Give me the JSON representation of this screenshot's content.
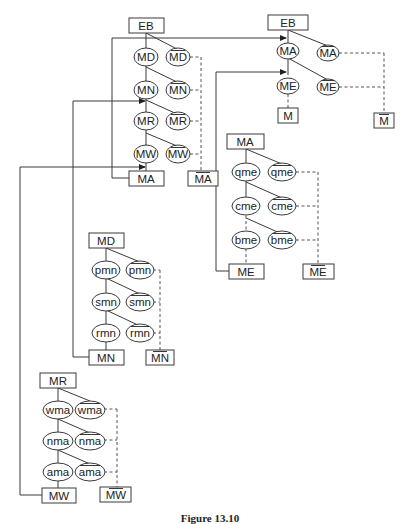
{
  "caption": "Figure 13.10",
  "trees": [
    {
      "id": "eb-top",
      "root": "EB",
      "chain": [
        {
          "left": "MA",
          "right": "MA",
          "right_overline": true
        },
        {
          "left": "ME",
          "right": "ME",
          "right_overline": true
        }
      ],
      "outputs": {
        "left": "M",
        "right": "M",
        "right_overline": true
      }
    },
    {
      "id": "eb-mid",
      "root": "EB",
      "chain": [
        {
          "left": "MD",
          "right": "MD",
          "right_overline": true
        },
        {
          "left": "MN",
          "right": "MN",
          "right_overline": true
        },
        {
          "left": "MR",
          "right": "MR",
          "right_overline": true
        },
        {
          "left": "MW",
          "right": "MW",
          "right_overline": true
        }
      ],
      "outputs": {
        "left": "MA",
        "right": "MA",
        "right_overline": true
      }
    },
    {
      "id": "ma",
      "root": "MA",
      "chain": [
        {
          "left": "qme",
          "right": "qme",
          "right_overline": true
        },
        {
          "left": "cme",
          "right": "cme",
          "right_overline": true
        },
        {
          "left": "bme",
          "right": "bme",
          "right_overline": true
        }
      ],
      "outputs": {
        "left": "ME",
        "right": "ME",
        "right_overline": true
      }
    },
    {
      "id": "md",
      "root": "MD",
      "chain": [
        {
          "left": "pmn",
          "right": "pmn",
          "right_overline": true
        },
        {
          "left": "smn",
          "right": "smn",
          "right_overline": true
        },
        {
          "left": "rmn",
          "right": "rmn",
          "right_overline": true
        }
      ],
      "outputs": {
        "left": "MN",
        "right": "MN",
        "right_overline": true
      }
    },
    {
      "id": "mr",
      "root": "MR",
      "chain": [
        {
          "left": "wma",
          "right": "wma",
          "right_overline": true
        },
        {
          "left": "nma",
          "right": "nma",
          "right_overline": true
        },
        {
          "left": "ama",
          "right": "ama",
          "right_overline": true
        }
      ],
      "outputs": {
        "left": "MW",
        "right": "MW",
        "right_overline": true
      }
    }
  ],
  "feedback_links": [
    {
      "from": "eb-mid.outputs.left (MA)",
      "to": "eb-top.chain.0 (MA)"
    },
    {
      "from": "ma.outputs.left (ME)",
      "to": "eb-top.chain.1 (ME)"
    },
    {
      "from": "md.outputs.left (MN)",
      "to": "eb-mid.chain.1 (MN)"
    },
    {
      "from": "mr.outputs.left (MW)",
      "to": "eb-mid.chain.3 (MW)"
    }
  ]
}
